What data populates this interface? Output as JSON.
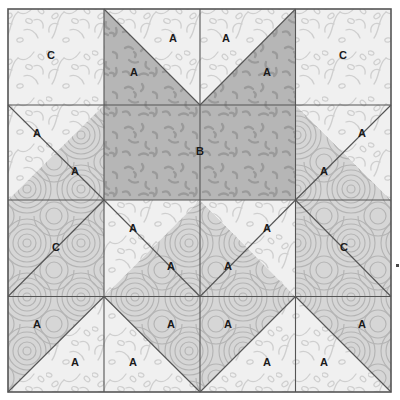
{
  "block": {
    "title": "Quilt Block Diagram",
    "bounds": {
      "x": 8,
      "y": 9,
      "width": 383,
      "height": 383
    },
    "grid_lines_x": [
      8,
      104,
      200,
      295.5,
      391
    ],
    "grid_lines_y": [
      9,
      105,
      200,
      296.5,
      392
    ],
    "border_color": "#555555",
    "seam_color": "#555555",
    "seam_width": 1.1,
    "background": "#ffffff"
  },
  "fabrics": {
    "light_vine": {
      "name": "light-vine-print",
      "fill": "#f0f0f0",
      "motif": "vine",
      "motif_color": "#cfcfcf"
    },
    "light_swirl": {
      "name": "light-swirl-print",
      "fill": "#ededed",
      "motif": "swirl",
      "motif_color": "#c9c9c9"
    },
    "medium_swirl": {
      "name": "medium-swirl-print",
      "fill": "#d6d6d6",
      "motif": "swirl",
      "motif_color": "#b4b4b4"
    },
    "dark_dash": {
      "name": "dark-dash-print",
      "fill": "#b6b6b6",
      "motif": "dash",
      "motif_color": "#9a9a9a"
    }
  },
  "patches": [
    {
      "id": "r1c1-C",
      "label": "C",
      "fabric": "light_vine",
      "shape": "square",
      "points": "8,9 104,9 104,105 8,105",
      "label_x": 51,
      "label_y": 56
    },
    {
      "id": "r1c2-A-dark",
      "label": "A",
      "fabric": "dark_dash",
      "shape": "triangle",
      "points": "104,9 104,105 200,105",
      "label_x": 134,
      "label_y": 73
    },
    {
      "id": "r1c2-A-light",
      "label": "A",
      "fabric": "light_vine",
      "shape": "triangle",
      "points": "104,9 200,9 200,105",
      "label_x": 173,
      "label_y": 39
    },
    {
      "id": "r1c3-A-light",
      "label": "A",
      "fabric": "light_vine",
      "shape": "triangle",
      "points": "200,9 295.5,9 200,105",
      "label_x": 226,
      "label_y": 39
    },
    {
      "id": "r1c3-A-dark",
      "label": "A",
      "fabric": "dark_dash",
      "shape": "triangle",
      "points": "295.5,9 295.5,105 200,105",
      "label_x": 267,
      "label_y": 73
    },
    {
      "id": "r1c4-C",
      "label": "C",
      "fabric": "light_vine",
      "shape": "square",
      "points": "295.5,9 391,9 391,105 295.5,105",
      "label_x": 343,
      "label_y": 56
    },
    {
      "id": "r2c1-A-light",
      "label": "A",
      "fabric": "light_vine",
      "shape": "triangle",
      "points": "8,105 104,105 8,200",
      "label_x": 37,
      "label_y": 134
    },
    {
      "id": "r2c1-A-med",
      "label": "A",
      "fabric": "medium_swirl",
      "shape": "triangle",
      "points": "104,105 104,200 8,200",
      "label_x": 75,
      "label_y": 172
    },
    {
      "id": "r2c23-B",
      "label": "B",
      "fabric": "dark_dash",
      "shape": "rect",
      "points": "104,105 295.5,105 295.5,200 104,200",
      "label_x": 200,
      "label_y": 152
    },
    {
      "id": "r2c4-A-med",
      "label": "A",
      "fabric": "medium_swirl",
      "shape": "triangle",
      "points": "295.5,105 295.5,200 391,200",
      "label_x": 324,
      "label_y": 172
    },
    {
      "id": "r2c4-A-light",
      "label": "A",
      "fabric": "light_vine",
      "shape": "triangle",
      "points": "295.5,105 391,105 391,200",
      "label_x": 362,
      "label_y": 134
    },
    {
      "id": "r3c1-C",
      "label": "C",
      "fabric": "medium_swirl",
      "shape": "square",
      "points": "8,200 104,200 104,296.5 8,296.5",
      "label_x": 56,
      "label_y": 248
    },
    {
      "id": "r3c2-A-light",
      "label": "A",
      "fabric": "light_vine",
      "shape": "triangle",
      "points": "104,200 200,200 104,296.5",
      "label_x": 133,
      "label_y": 229
    },
    {
      "id": "r3c2-A-med",
      "label": "A",
      "fabric": "medium_swirl",
      "shape": "triangle",
      "points": "200,200 200,296.5 104,296.5",
      "label_x": 171,
      "label_y": 267
    },
    {
      "id": "r3c3-A-med",
      "label": "A",
      "fabric": "medium_swirl",
      "shape": "triangle",
      "points": "200,200 295.5,296.5 200,296.5",
      "label_x": 228,
      "label_y": 267
    },
    {
      "id": "r3c3-A-light",
      "label": "A",
      "fabric": "light_vine",
      "shape": "triangle",
      "points": "200,200 295.5,200 295.5,296.5",
      "label_x": 267,
      "label_y": 229
    },
    {
      "id": "r3c4-C",
      "label": "C",
      "fabric": "medium_swirl",
      "shape": "square",
      "points": "295.5,200 391,200 391,296.5 295.5,296.5",
      "label_x": 344,
      "label_y": 248
    },
    {
      "id": "r4c1-A-med",
      "label": "A",
      "fabric": "medium_swirl",
      "shape": "triangle",
      "points": "8,296.5 104,296.5 8,392",
      "label_x": 37,
      "label_y": 325
    },
    {
      "id": "r4c1-A-light",
      "label": "A",
      "fabric": "light_vine",
      "shape": "triangle",
      "points": "104,296.5 104,392 8,392",
      "label_x": 75,
      "label_y": 363
    },
    {
      "id": "r4c2-A-light",
      "label": "A",
      "fabric": "light_vine",
      "shape": "triangle",
      "points": "104,296.5 104,392 200,392",
      "label_x": 133,
      "label_y": 363
    },
    {
      "id": "r4c2-A-med",
      "label": "A",
      "fabric": "medium_swirl",
      "shape": "triangle",
      "points": "104,296.5 200,296.5 200,392",
      "label_x": 171,
      "label_y": 325
    },
    {
      "id": "r4c3-A-med",
      "label": "A",
      "fabric": "medium_swirl",
      "shape": "triangle",
      "points": "200,296.5 295.5,296.5 200,392",
      "label_x": 228,
      "label_y": 325
    },
    {
      "id": "r4c3-A-light",
      "label": "A",
      "fabric": "light_vine",
      "shape": "triangle",
      "points": "295.5,296.5 295.5,392 200,392",
      "label_x": 267,
      "label_y": 363
    },
    {
      "id": "r4c4-A-light",
      "label": "A",
      "fabric": "light_vine",
      "shape": "triangle",
      "points": "295.5,296.5 295.5,392 391,392",
      "label_x": 324,
      "label_y": 363
    },
    {
      "id": "r4c4-A-med",
      "label": "A",
      "fabric": "medium_swirl",
      "shape": "triangle",
      "points": "295.5,296.5 391,296.5 391,392",
      "label_x": 362,
      "label_y": 325
    }
  ],
  "seams": [
    "M104,9 L104,392",
    "M200,9 L200,392",
    "M295.5,9 L295.5,392",
    "M8,105 L391,105",
    "M8,200 L391,200",
    "M8,296.5 L391,296.5",
    "M104,9 L200,105",
    "M295.5,9 L200,105",
    "M8,105 L104,200",
    "M391,105 L295.5,200",
    "M104,200 L200,296.5",
    "M295.5,200 L200,296.5",
    "M104,200 L8,296.5",
    "M295.5,200 L391,296.5",
    "M8,392 L104,296.5",
    "M104,296.5 L200,392",
    "M200,392 L295.5,296.5",
    "M295.5,296.5 L391,392"
  ],
  "marker": {
    "name": "right-edge-tick",
    "x": 396,
    "y": 264,
    "color": "#4a4a4a"
  }
}
